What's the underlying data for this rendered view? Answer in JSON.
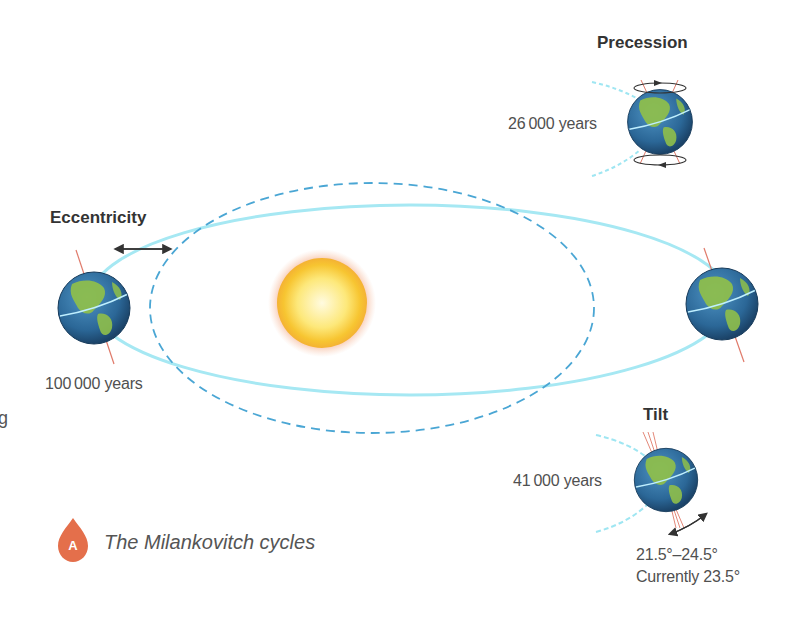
{
  "diagram": {
    "caption": {
      "badge_letter": "A",
      "text": "The Milankovitch cycles",
      "badge_color": "#e46f4b"
    },
    "cycles": {
      "eccentricity": {
        "title": "Eccentricity",
        "period": "100 000 years"
      },
      "precession": {
        "title": "Precession",
        "period": "26 000 years"
      },
      "tilt": {
        "title": "Tilt",
        "period": "41 000 years",
        "range": "21.5°–24.5°",
        "current": "Currently 23.5°"
      }
    },
    "stray_text": "g",
    "colors": {
      "orbit": "#9fe6f2",
      "orbit_dashed": "#4aa6d4",
      "sun_core": "#fff6b0",
      "sun_edge": "#f7c531",
      "sun_glow": "#f29a6b",
      "earth_ocean": "#2d6b9a",
      "earth_land": "#8fbf4a",
      "axis": "#e07a6a",
      "arrow": "#333333"
    }
  }
}
